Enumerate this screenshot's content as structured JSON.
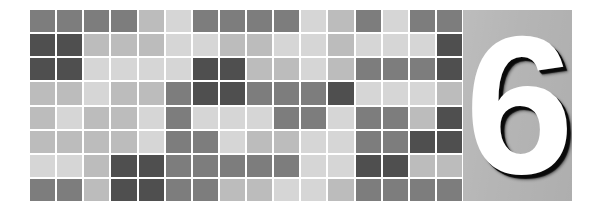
{
  "page": {
    "width": 602,
    "height": 213,
    "background": "#ffffff"
  },
  "banner": {
    "label": "chapter-opener-banner"
  },
  "number_panel": {
    "chapter_number": "6",
    "panel_color": "#b5b5b5",
    "number_color": "#ffffff",
    "shadow_color": "#0a0a0a"
  },
  "mosaic": {
    "columns": 16,
    "rows": 8,
    "gap_color": "#ffffff",
    "palette": {
      "d": "#4f4f4f",
      "m": "#7d7d7d",
      "g": "#9a9a9a",
      "l": "#bcbcbc",
      "p": "#d6d6d6",
      "w": "#ececec"
    },
    "grid": [
      [
        "m",
        "m",
        "m",
        "m",
        "l",
        "p",
        "m",
        "m",
        "m",
        "m",
        "p",
        "l",
        "m",
        "p",
        "m",
        "m"
      ],
      [
        "d",
        "d",
        "l",
        "l",
        "l",
        "p",
        "p",
        "l",
        "l",
        "p",
        "p",
        "l",
        "p",
        "p",
        "p",
        "d"
      ],
      [
        "d",
        "d",
        "p",
        "p",
        "p",
        "p",
        "d",
        "d",
        "l",
        "l",
        "p",
        "l",
        "m",
        "m",
        "m",
        "d"
      ],
      [
        "l",
        "l",
        "p",
        "l",
        "l",
        "m",
        "d",
        "d",
        "m",
        "m",
        "m",
        "d",
        "p",
        "p",
        "p",
        "l"
      ],
      [
        "l",
        "p",
        "l",
        "l",
        "p",
        "m",
        "p",
        "p",
        "p",
        "m",
        "m",
        "p",
        "m",
        "m",
        "l",
        "d"
      ],
      [
        "l",
        "l",
        "l",
        "l",
        "p",
        "m",
        "m",
        "p",
        "l",
        "l",
        "p",
        "p",
        "m",
        "m",
        "d",
        "d"
      ],
      [
        "p",
        "p",
        "l",
        "d",
        "d",
        "m",
        "m",
        "m",
        "m",
        "m",
        "p",
        "p",
        "d",
        "d",
        "l",
        "l"
      ],
      [
        "m",
        "m",
        "l",
        "d",
        "d",
        "m",
        "m",
        "l",
        "l",
        "p",
        "p",
        "l",
        "m",
        "m",
        "m",
        "m"
      ]
    ]
  }
}
